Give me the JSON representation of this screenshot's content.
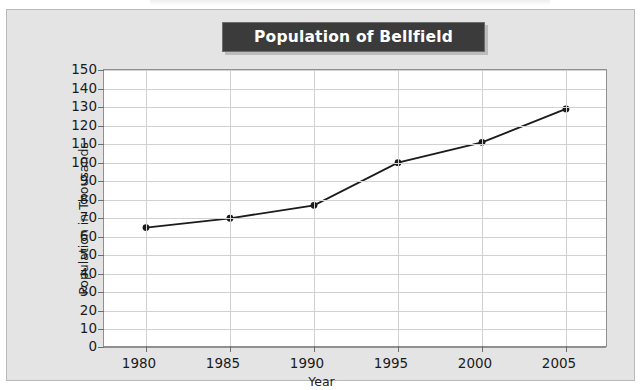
{
  "chart_data": {
    "type": "line",
    "title": "Population of Bellfield",
    "xlabel": "Year",
    "ylabel": "Population in Thousands",
    "categories": [
      1980,
      1985,
      1990,
      1995,
      2000,
      2005
    ],
    "x_tick_labels": [
      "1980",
      "1985",
      "1990",
      "1995",
      "2000",
      "2005"
    ],
    "values": [
      65,
      70,
      77,
      100,
      111,
      129
    ],
    "series": [
      {
        "name": "Population of Bellfield",
        "values": [
          65,
          70,
          77,
          100,
          111,
          129
        ]
      }
    ],
    "ylim": [
      0,
      150
    ],
    "y_step": 10,
    "y_tick_labels": [
      "0",
      "10",
      "20",
      "30",
      "40",
      "50",
      "60",
      "70",
      "80",
      "90",
      "100",
      "110",
      "120",
      "130",
      "140",
      "150"
    ],
    "xlim": [
      1977.5,
      2007.5
    ],
    "grid": "horizontal-and-vertical",
    "legend": "none",
    "marker": "filled-circle",
    "line_color": "#1b1b1b",
    "marker_color": "#1b1b1b",
    "plot_background": "#ffffff",
    "panel_background": "#e4e4e4",
    "title_background": "#3b3b3b",
    "title_color": "#ffffff",
    "gridline_color": "#d2d2d2",
    "axis_color": "#8f8f8f"
  }
}
